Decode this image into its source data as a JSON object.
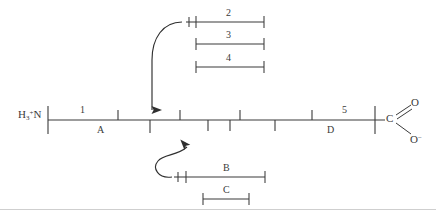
{
  "figure": {
    "type": "peptide-cleavage-diagram",
    "ink_color": "#3a3a3a",
    "background": "#ffffff",
    "termini": {
      "n_terminus": {
        "main": "N",
        "h": "H",
        "sub": "3",
        "sup": "+"
      },
      "c_terminus": {
        "carbon": "C",
        "carbonyl_oxygen": "O",
        "anionic_oxygen": "O",
        "charge": "−"
      }
    },
    "backbone": {
      "left_x": 48,
      "right_x": 375,
      "y": 120,
      "ticks_above": [
        118,
        180,
        240,
        312
      ],
      "ticks_below": [
        150,
        208,
        230,
        275
      ],
      "end_ticks": [
        48,
        375
      ]
    },
    "above_labels": [
      {
        "text": "1",
        "x": 83
      },
      {
        "text": "5",
        "x": 345
      }
    ],
    "below_labels": [
      {
        "text": "A",
        "x": 101
      },
      {
        "text": "D",
        "x": 331
      }
    ],
    "top_brackets": [
      {
        "text": "2",
        "x1": 196,
        "x2": 264,
        "y": 22,
        "label_x": 230,
        "label_y": 9,
        "has_tail_tick": true
      },
      {
        "text": "3",
        "x1": 196,
        "x2": 264,
        "y": 44,
        "label_x": 230,
        "label_y": 31,
        "has_tail_tick": false
      },
      {
        "text": "4",
        "x1": 196,
        "x2": 264,
        "y": 67,
        "label_x": 230,
        "label_y": 54,
        "has_tail_tick": false
      }
    ],
    "bottom_brackets": [
      {
        "text": "B",
        "x1": 186,
        "x2": 265,
        "y": 177,
        "label_x": 227,
        "label_y": 164,
        "has_tail_tick": true
      },
      {
        "text": "C",
        "x1": 203,
        "x2": 249,
        "y": 199,
        "label_x": 227,
        "label_y": 186,
        "has_tail_tick": false
      }
    ],
    "arrows": [
      {
        "name": "top-arrow",
        "direction": "down",
        "from_x": 182,
        "from_y": 22,
        "to_x": 152,
        "to_y": 117
      },
      {
        "name": "bottom-arrow",
        "direction": "up-right",
        "from_x": 173,
        "from_y": 177,
        "to_x": 196,
        "to_y": 136
      }
    ],
    "scanline_y": 209
  }
}
